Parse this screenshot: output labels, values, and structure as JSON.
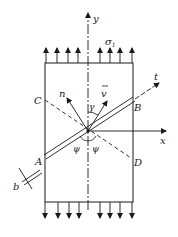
{
  "diagram": {
    "type": "stress-element-with-inclined-band",
    "labels": {
      "y_axis": "y",
      "x_axis": "x",
      "stress": "σ",
      "stress_sub": "1",
      "t_axis": "t",
      "normal": "n",
      "velocity": "v",
      "angle_gamma": "γ",
      "angle_psi_left": "ψ",
      "angle_psi_right": "ψ",
      "point_A": "A",
      "point_B": "B",
      "point_C": "C",
      "point_D": "D",
      "width": "b"
    },
    "colors": {
      "line": "#1a1a1a",
      "background": "#ffffff"
    }
  }
}
